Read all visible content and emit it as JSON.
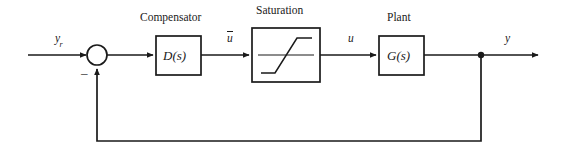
{
  "diagram": {
    "type": "control-system-block-diagram",
    "stroke_color": "#1a1a1a",
    "background_color": "#ffffff",
    "blocks": [
      {
        "id": "compensator",
        "title": "Compensator",
        "text": "D(s)",
        "x": 156,
        "y": 36,
        "w": 45,
        "h": 39
      },
      {
        "id": "saturation",
        "title": "Saturation",
        "text": "",
        "x": 252,
        "y": 28,
        "w": 68,
        "h": 54
      },
      {
        "id": "plant",
        "title": "Plant",
        "text": "G(s)",
        "x": 379,
        "y": 36,
        "w": 45,
        "h": 39
      }
    ],
    "signals": [
      {
        "id": "reference",
        "label": "y",
        "subscript": "r",
        "x": 55,
        "y": 36
      },
      {
        "id": "control-presat",
        "label": "u",
        "overbar": true,
        "x": 228,
        "y": 36
      },
      {
        "id": "control-postsat",
        "label": "u",
        "overbar": false,
        "x": 348,
        "y": 36
      },
      {
        "id": "output",
        "label": "y",
        "overbar": false,
        "x": 505,
        "y": 36
      }
    ],
    "summing_junction": {
      "id": "summer",
      "cx": 97,
      "cy": 55,
      "r": 10,
      "feedback_sign": "–",
      "sign_x": 83,
      "sign_y": 70
    },
    "feedback": {
      "takeoff_x": 481,
      "takeoff_y": 55,
      "path_y": 141,
      "return_x": 97
    }
  }
}
